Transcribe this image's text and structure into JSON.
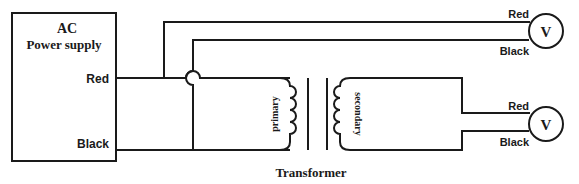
{
  "diagram": {
    "type": "circuit-schematic",
    "power_supply": {
      "title_line1": "AC",
      "title_line2": "Power supply",
      "terminal_red": "Red",
      "terminal_black": "Black"
    },
    "transformer": {
      "label": "Transformer",
      "primary_label": "primary",
      "secondary_label": "secondary"
    },
    "voltmeter_top": {
      "symbol": "V",
      "lead_red": "Red",
      "lead_black": "Black"
    },
    "voltmeter_bottom": {
      "symbol": "V",
      "lead_red": "Red",
      "lead_black": "Black"
    },
    "colors": {
      "line": "#1a1a1a",
      "background": "#ffffff"
    }
  }
}
